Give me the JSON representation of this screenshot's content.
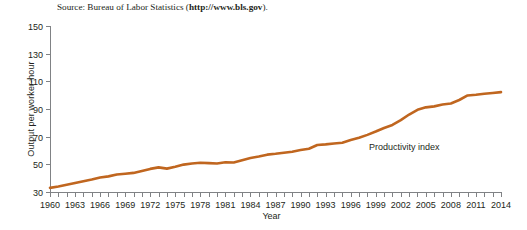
{
  "source_note": {
    "prefix": "Source: Bureau of Labor Statistics (",
    "url": "http://www.bls.gov",
    "suffix": ")."
  },
  "chart_data": {
    "type": "line",
    "title": "",
    "xlabel": "Year",
    "ylabel": "Output per worker-hour",
    "xlim": [
      1960,
      2014
    ],
    "ylim": [
      30,
      150
    ],
    "grid": false,
    "legend": "none",
    "annotations": [
      {
        "text": "Productivity index",
        "x": 1997,
        "y": 63
      }
    ],
    "ytick_labels": [
      "30",
      "50",
      "70",
      "90",
      "110",
      "130",
      "150"
    ],
    "yticks": [
      30,
      50,
      70,
      90,
      110,
      130,
      150
    ],
    "xtick_labels": [
      "1960",
      "1963",
      "1966",
      "1969",
      "1972",
      "1975",
      "1978",
      "1981",
      "1984",
      "1987",
      "1990",
      "1993",
      "1996",
      "1999",
      "2002",
      "2005",
      "2008",
      "2011",
      "2014"
    ],
    "xticks_labeled": [
      1960,
      1963,
      1966,
      1969,
      1972,
      1975,
      1978,
      1981,
      1984,
      1987,
      1990,
      1993,
      1996,
      1999,
      2002,
      2005,
      2008,
      2011,
      2014
    ],
    "xticks_minor_step": 1,
    "series": [
      {
        "name": "Productivity index",
        "color": "#C0661F",
        "x": [
          1960,
          1961,
          1962,
          1963,
          1964,
          1965,
          1966,
          1967,
          1968,
          1969,
          1970,
          1971,
          1972,
          1973,
          1974,
          1975,
          1976,
          1977,
          1978,
          1979,
          1980,
          1981,
          1982,
          1983,
          1984,
          1985,
          1986,
          1987,
          1988,
          1989,
          1990,
          1991,
          1992,
          1993,
          1994,
          1995,
          1996,
          1997,
          1998,
          1999,
          2000,
          2001,
          2002,
          2003,
          2004,
          2005,
          2006,
          2007,
          2008,
          2009,
          2010,
          2011,
          2012,
          2013,
          2014
        ],
        "values": [
          33.0,
          34.0,
          35.2,
          36.5,
          37.8,
          39.0,
          40.5,
          41.3,
          42.6,
          43.2,
          43.8,
          45.2,
          46.7,
          47.8,
          46.9,
          48.2,
          49.8,
          50.6,
          51.1,
          50.9,
          50.6,
          51.5,
          51.3,
          53.0,
          54.6,
          55.6,
          57.0,
          57.6,
          58.4,
          59.1,
          60.3,
          61.3,
          64.0,
          64.4,
          65.1,
          65.6,
          67.6,
          69.2,
          71.3,
          73.7,
          76.3,
          78.5,
          82.0,
          86.0,
          89.4,
          91.2,
          91.9,
          93.2,
          94.0,
          96.5,
          99.8,
          100.3,
          101.0,
          101.6,
          102.2
        ]
      }
    ]
  },
  "colors": {
    "series": "#C0661F",
    "axis": "#808285",
    "text": "#231f20",
    "background": "#ffffff"
  }
}
